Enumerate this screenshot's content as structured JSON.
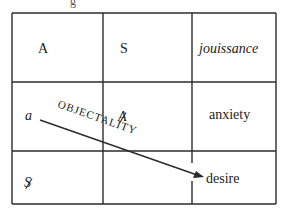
{
  "diagram": {
    "type": "table-with-arrow",
    "top_fragment": "g",
    "grid": {
      "rows": 3,
      "columns": 3,
      "cells": [
        [
          "A",
          "S",
          "jouissance"
        ],
        [
          "a",
          "A",
          "anxiety"
        ],
        [
          "S",
          "",
          "desire"
        ]
      ],
      "barred_cells": [
        [
          1,
          1
        ],
        [
          2,
          0
        ]
      ],
      "italic_cells": [
        [
          0,
          2
        ],
        [
          1,
          0
        ]
      ]
    },
    "cells": {
      "r0c0": "A",
      "r0c1": "S",
      "r0c2": "jouissance",
      "r1c0": "a",
      "r1c1": "A",
      "r1c2": "anxiety",
      "r2c0": "S",
      "r2c1": "",
      "r2c2": "desire"
    },
    "arrow": {
      "label": "OBJECTALITY",
      "from": "a",
      "to": "desire"
    },
    "colors": {
      "line": "#2b2b2b",
      "text": "#222222",
      "background": "#ffffff"
    }
  }
}
